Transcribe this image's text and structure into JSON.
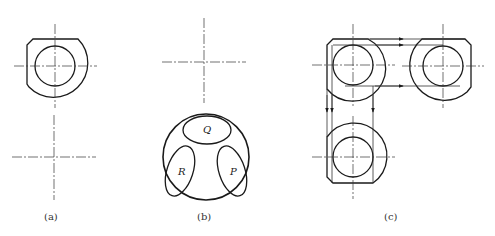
{
  "figure": {
    "panels": [
      {
        "id": "a",
        "label": "(a)"
      },
      {
        "id": "b",
        "label": "(b)",
        "faces": [
          "Q",
          "R",
          "P"
        ]
      },
      {
        "id": "c",
        "label": "(c)"
      }
    ]
  },
  "colors": {
    "line": "#1a1a1a",
    "background": "#ffffff"
  }
}
